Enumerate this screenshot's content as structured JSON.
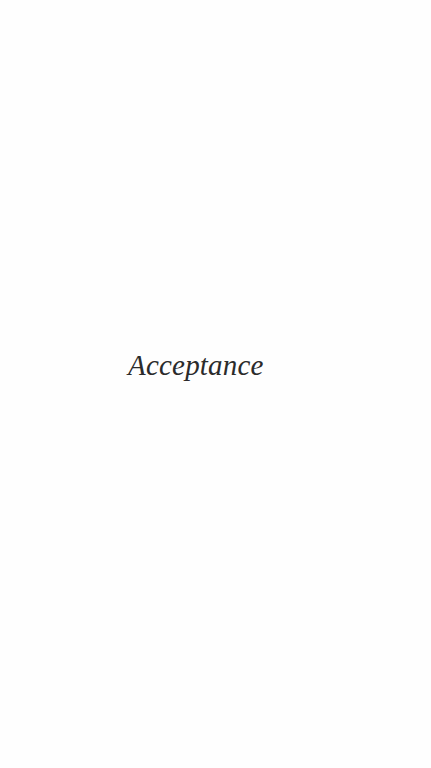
{
  "page": {
    "heading": "Acceptance",
    "background_color": "#fefefe",
    "text_color": "#2b2b2b"
  }
}
